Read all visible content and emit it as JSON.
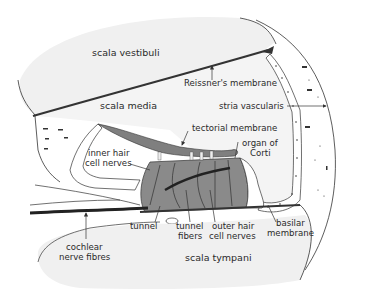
{
  "diagram": {
    "type": "anatomical cross-section",
    "subject": "cochlea",
    "regions": {
      "scala_vestibuli": "scala vestibuli",
      "scala_media": "scala media",
      "scala_tympani": "scala tympani"
    },
    "labels": {
      "reissners_membrane": "Reissner's membrane",
      "stria_vascularis": "stria vascularis",
      "tectorial_membrane": "tectorial membrane",
      "organ_of_corti_1": "organ of",
      "organ_of_corti_2": "Corti",
      "inner_hair_1": "inner hair",
      "inner_hair_2": "cell nerves",
      "tunnel": "tunnel",
      "tunnel_fibers_1": "tunnel",
      "tunnel_fibers_2": "fibers",
      "outer_hair_1": "outer hair",
      "outer_hair_2": "cell nerves",
      "basilar_1": "basilar",
      "basilar_2": "membrane",
      "cochlear_1": "cochlear",
      "cochlear_2": "nerve fibres"
    },
    "colors": {
      "fluid_fill": "#f2f2f2",
      "tissue_dark": "#8a8a8a",
      "outline": "#333333",
      "background": "#ffffff"
    }
  }
}
